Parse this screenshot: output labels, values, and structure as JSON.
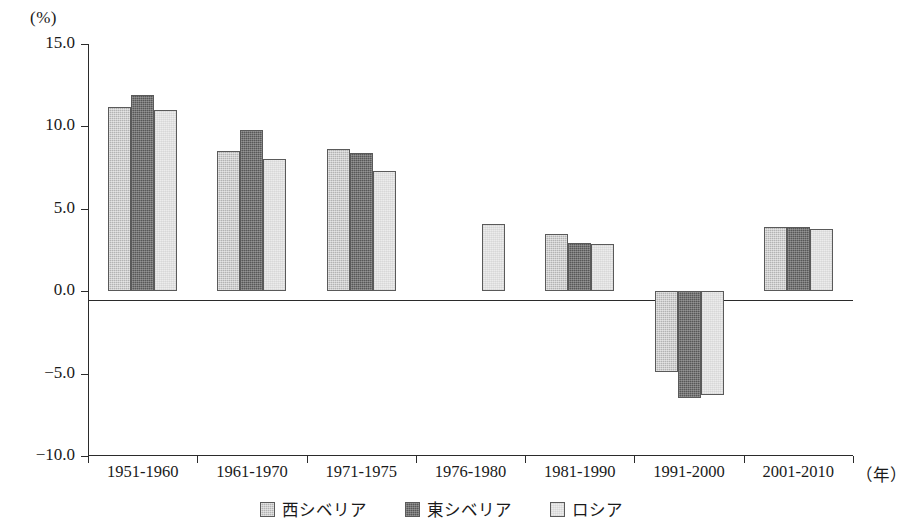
{
  "chart_data": {
    "type": "bar",
    "title": "",
    "subtitle": "",
    "xlabel": "年",
    "ylabel": "",
    "unit_label": "(%)",
    "x_axis_unit_label": "（年）",
    "ylim": [
      -10.0,
      15.0
    ],
    "ytick_labels": [
      "15.0",
      "10.0",
      "5.0",
      "0.0",
      "−5.0",
      "−10.0"
    ],
    "yticks": [
      15.0,
      10.0,
      5.0,
      0.0,
      -5.0,
      -10.0
    ],
    "grid": false,
    "legend_position": "bottom-center",
    "categories": [
      "1951-1960",
      "1961-1970",
      "1971-1975",
      "1976-1980",
      "1981-1990",
      "1991-2000",
      "2001-2010"
    ],
    "series": [
      {
        "name": "西シベリア",
        "color": "#b3b3b3",
        "values": [
          11.2,
          8.5,
          8.6,
          null,
          3.5,
          -4.9,
          3.9
        ]
      },
      {
        "name": "東シベリア",
        "color": "#575757",
        "values": [
          11.9,
          9.8,
          8.4,
          null,
          2.9,
          -6.5,
          3.9
        ]
      },
      {
        "name": "ロシア",
        "color": "#ececec",
        "values": [
          11.0,
          8.0,
          7.3,
          4.1,
          2.85,
          -6.3,
          3.8
        ]
      }
    ]
  },
  "legend": {
    "items": [
      {
        "label": "西シベリア",
        "swatch": "west-siberia-swatch"
      },
      {
        "label": "東シベリア",
        "swatch": "east-siberia-swatch"
      },
      {
        "label": "ロシア",
        "swatch": "russia-swatch"
      }
    ]
  }
}
